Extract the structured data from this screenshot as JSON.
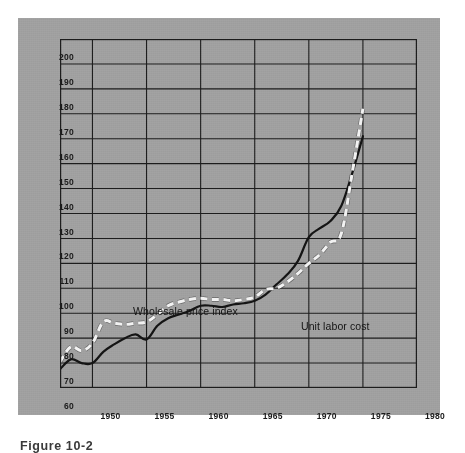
{
  "figure": {
    "caption": "Figure 10-2",
    "panel_color": "#a0a0a0",
    "axis_color": "#1d1d1d"
  },
  "chart_data": {
    "type": "line",
    "title": "",
    "subtitle": "",
    "xlabel": "",
    "ylabel": "",
    "xlim": [
      1947,
      1980
    ],
    "ylim": [
      60,
      200
    ],
    "grid": true,
    "legend_position": "inline-annotation",
    "y_ticks": [
      60,
      70,
      80,
      90,
      100,
      110,
      120,
      130,
      140,
      150,
      160,
      170,
      180,
      190,
      200
    ],
    "y_tick_labels": [
      "60",
      "70",
      "80",
      "90",
      "100",
      "110",
      "120",
      "130",
      "140",
      "150",
      "160",
      "170",
      "180",
      "190",
      "200"
    ],
    "x_ticks": [
      1950,
      1955,
      1960,
      1965,
      1970,
      1975,
      1980
    ],
    "x_tick_labels": [
      "1950",
      "1955",
      "1960",
      "1965",
      "1970",
      "1975",
      "1980"
    ],
    "x_gridlines": [
      1950,
      1955,
      1960,
      1965,
      1970,
      1975,
      1980
    ],
    "series": [
      {
        "name": "Wholesale price index",
        "style": "dashed",
        "color": "#f2f2f2",
        "label_x": 1953.2,
        "label_y": 101.5,
        "x": [
          1947,
          1948,
          1949,
          1950,
          1951,
          1952,
          1953,
          1954,
          1955,
          1956,
          1957,
          1958,
          1959,
          1960,
          1961,
          1962,
          1963,
          1964,
          1965,
          1966,
          1967,
          1968,
          1969,
          1970,
          1971,
          1972,
          1973,
          1974,
          1975
        ],
        "values": [
          70.5,
          76.5,
          75.0,
          78.0,
          86.5,
          86.0,
          85.5,
          86.0,
          86.5,
          89.5,
          93.0,
          94.5,
          95.5,
          96.0,
          95.5,
          95.5,
          95.0,
          95.5,
          96.5,
          99.5,
          100.0,
          102.5,
          106.0,
          110.0,
          113.5,
          118.5,
          122.0,
          146.0,
          172.0
        ]
      },
      {
        "name": "Unit labor cost",
        "style": "solid",
        "color": "#141414",
        "label_x": 1968.0,
        "label_y": 97.5,
        "x": [
          1947,
          1948,
          1949,
          1950,
          1951,
          1952,
          1953,
          1954,
          1955,
          1956,
          1957,
          1958,
          1959,
          1960,
          1961,
          1962,
          1963,
          1964,
          1965,
          1966,
          1967,
          1968,
          1969,
          1970,
          1971,
          1972,
          1973,
          1974,
          1975
        ],
        "values": [
          67.5,
          71.5,
          70.0,
          70.0,
          74.5,
          77.5,
          80.0,
          81.5,
          79.5,
          85.0,
          88.0,
          89.5,
          91.0,
          93.0,
          93.0,
          92.5,
          93.5,
          94.0,
          95.0,
          97.5,
          101.5,
          105.5,
          111.0,
          120.5,
          124.0,
          127.0,
          133.0,
          146.0,
          161.0
        ]
      }
    ]
  },
  "annotations": {
    "wholesale_label": "Wholesale price index",
    "unit_labor_label": "Unit labor cost"
  }
}
